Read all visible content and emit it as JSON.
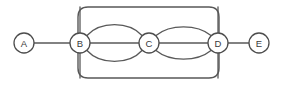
{
  "diagram": {
    "type": "node-link-graph",
    "canvas": {
      "width": 283,
      "height": 86,
      "background": "#ffffff"
    },
    "style": {
      "edge_color": "#595959",
      "node_stroke": "#4d4d4d",
      "node_fill": "#ffffff",
      "cluster_stroke": "#585858",
      "label_color": "#3a3a3a"
    },
    "nodes": [
      {
        "id": "A",
        "label": "A",
        "cx": 24,
        "cy": 43,
        "r": 10
      },
      {
        "id": "B",
        "label": "B",
        "cx": 80,
        "cy": 43,
        "r": 10
      },
      {
        "id": "C",
        "label": "C",
        "cx": 149,
        "cy": 43,
        "r": 10
      },
      {
        "id": "D",
        "label": "D",
        "cx": 218,
        "cy": 43,
        "r": 10
      },
      {
        "id": "E",
        "label": "E",
        "cx": 259,
        "cy": 43,
        "r": 10
      }
    ],
    "cluster": {
      "id": "cluster-1",
      "x": 78,
      "y": 7,
      "width": 141,
      "height": 71,
      "rx": 10
    },
    "edges": [
      {
        "id": "A-B",
        "from": "A",
        "to": "B",
        "shape": "straight"
      },
      {
        "id": "B-C-top",
        "from": "B",
        "to": "C",
        "shape": "arc-up"
      },
      {
        "id": "B-C-mid",
        "from": "B",
        "to": "C",
        "shape": "straight"
      },
      {
        "id": "B-C-bottom",
        "from": "B",
        "to": "C",
        "shape": "arc-down"
      },
      {
        "id": "C-D-top",
        "from": "C",
        "to": "D",
        "shape": "arc-up"
      },
      {
        "id": "C-D-mid",
        "from": "C",
        "to": "D",
        "shape": "straight"
      },
      {
        "id": "C-D-bottom",
        "from": "C",
        "to": "D",
        "shape": "arc-down"
      },
      {
        "id": "D-E",
        "from": "D",
        "to": "E",
        "shape": "straight"
      },
      {
        "id": "B-top",
        "from": "B",
        "to": "cluster-top",
        "shape": "vertical"
      },
      {
        "id": "B-bottom",
        "from": "B",
        "to": "cluster-bottom",
        "shape": "vertical"
      },
      {
        "id": "D-top",
        "from": "D",
        "to": "cluster-top",
        "shape": "vertical"
      },
      {
        "id": "D-bottom",
        "from": "D",
        "to": "cluster-bottom",
        "shape": "vertical"
      }
    ],
    "paths": {
      "cluster_rect": "M 88 7 L 209 7 Q 219 7 219 17 L 219 68 Q 219 78 209 78 L 88 78 Q 78 78 78 68 L 78 17 Q 78 7 88 7 Z",
      "a_b": "M 34 43 L 70 43",
      "d_e": "M 228 43 L 249 43",
      "b_c_mid": "M 90 43 L 139 43",
      "c_d_mid": "M 159 43 L 208 43",
      "b_c_top": "M 87 35.5 C 100 21, 129 21, 142 35.5",
      "b_c_bottom": "M 87 50.5 C 100 65, 129 65, 142 50.5",
      "c_d_top": "M 156 35.5 C 170 24, 197 24, 211 35.5",
      "c_d_bottom": "M 156 50.5 C 170 62, 197 62, 211 50.5",
      "b_up": "M 80 33 L 80 7",
      "b_down": "M 80 53 L 80 78",
      "d_up": "M 218 33 L 218 7",
      "d_down": "M 218 53 L 218 78"
    }
  }
}
